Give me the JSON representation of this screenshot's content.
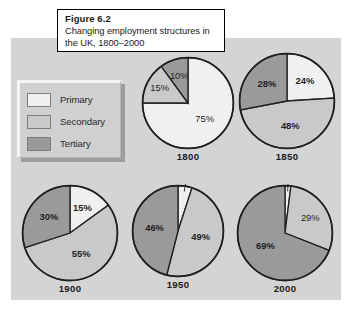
{
  "caption": {
    "figure_number": "Figure 6.2",
    "description_line1": "Changing employment structures in",
    "description_line2": "the UK, 1800–2000"
  },
  "legend": {
    "items": [
      {
        "label": "Primary",
        "color": "#f0f0f0"
      },
      {
        "label": "Secondary",
        "color": "#c9c9c9"
      },
      {
        "label": "Tertiary",
        "color": "#9a9a9a"
      }
    ]
  },
  "colors": {
    "panel_background": "#d4d4d4",
    "page_background": "#ffffff",
    "primary": "#f0f0f0",
    "secondary": "#c9c9c9",
    "tertiary": "#9a9a9a",
    "outline": "#1f1f1f"
  },
  "chart_data": {
    "type": "pie",
    "title": "Changing employment structures in the UK, 1800–2000",
    "legend_position": "left",
    "units": "percent",
    "categories": [
      "Primary",
      "Secondary",
      "Tertiary"
    ],
    "charts": [
      {
        "name": "1800",
        "labels": [
          "75%",
          "15%",
          "10%"
        ],
        "values": [
          75,
          15,
          10
        ]
      },
      {
        "name": "1850",
        "labels": [
          "24%",
          "48%",
          "28%"
        ],
        "values": [
          24,
          48,
          28
        ]
      },
      {
        "name": "1900",
        "labels": [
          "15%",
          "55%",
          "30%"
        ],
        "values": [
          15,
          55,
          30
        ]
      },
      {
        "name": "1950",
        "labels": [
          "5%",
          "49%",
          "46%"
        ],
        "values": [
          5,
          49,
          46
        ]
      },
      {
        "name": "2000",
        "labels": [
          "2%",
          "29%",
          "69%"
        ],
        "values": [
          2,
          29,
          69
        ]
      }
    ]
  }
}
